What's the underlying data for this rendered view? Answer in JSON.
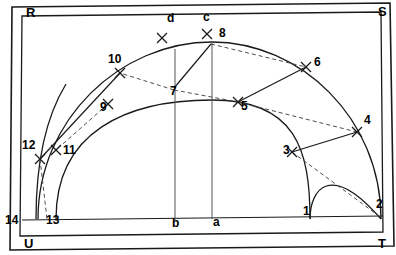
{
  "figure": {
    "type": "geometric-construction-diagram",
    "title": "",
    "background_color": "#ffffff",
    "ink_color": "#1a1a1a",
    "width": 396,
    "height": 255
  },
  "corner_labels": [
    {
      "id": "R",
      "text": "R",
      "x": 26,
      "y": 17
    },
    {
      "id": "S",
      "text": "S",
      "x": 378,
      "y": 16
    },
    {
      "id": "U",
      "text": "U",
      "x": 24,
      "y": 248
    },
    {
      "id": "T",
      "text": "T",
      "x": 378,
      "y": 248
    }
  ],
  "aux_labels": [
    {
      "id": "d",
      "text": "d",
      "x": 167,
      "y": 22
    },
    {
      "id": "c",
      "text": "c",
      "x": 203,
      "y": 21
    },
    {
      "id": "b",
      "text": "b",
      "x": 172,
      "y": 227
    },
    {
      "id": "a",
      "text": "a",
      "x": 213,
      "y": 226
    }
  ],
  "point_labels": [
    {
      "id": "1",
      "text": "1",
      "x": 303,
      "y": 215
    },
    {
      "id": "2",
      "text": "2",
      "x": 376,
      "y": 208
    },
    {
      "id": "3",
      "text": "3",
      "x": 283,
      "y": 154
    },
    {
      "id": "4",
      "text": "4",
      "x": 364,
      "y": 124
    },
    {
      "id": "5",
      "text": "5",
      "x": 241,
      "y": 110
    },
    {
      "id": "6",
      "text": "6",
      "x": 314,
      "y": 66
    },
    {
      "id": "7",
      "text": "7",
      "x": 170,
      "y": 95
    },
    {
      "id": "8",
      "text": "8",
      "x": 219,
      "y": 37
    },
    {
      "id": "9",
      "text": "9",
      "x": 100,
      "y": 111
    },
    {
      "id": "10",
      "text": "10",
      "x": 108,
      "y": 63
    },
    {
      "id": "11",
      "text": "11",
      "x": 63,
      "y": 154
    },
    {
      "id": "12",
      "text": "12",
      "x": 22,
      "y": 149
    },
    {
      "id": "13",
      "text": "13",
      "x": 46,
      "y": 224
    },
    {
      "id": "14",
      "text": "14",
      "x": 5,
      "y": 224
    }
  ],
  "cross_marks": [
    {
      "id": "mark-d",
      "x": 162,
      "y": 38
    },
    {
      "id": "mark-c",
      "x": 207,
      "y": 34
    },
    {
      "id": "mark-3",
      "x": 292,
      "y": 152
    },
    {
      "id": "mark-4",
      "x": 357,
      "y": 132
    },
    {
      "id": "mark-5",
      "x": 238,
      "y": 102
    },
    {
      "id": "mark-6",
      "x": 306,
      "y": 67
    },
    {
      "id": "mark-9",
      "x": 108,
      "y": 104
    },
    {
      "id": "mark-10",
      "x": 120,
      "y": 73
    },
    {
      "id": "mark-11",
      "x": 56,
      "y": 150
    },
    {
      "id": "mark-12",
      "x": 40,
      "y": 159
    }
  ],
  "frame": {
    "outer": "M 12,7 L 390,3 L 394,246 L 10,250 Z",
    "inner": "M 22,16 L 381,12 L 383,232 L 20,236 Z"
  },
  "baseline": {
    "from_x": 22,
    "from_y": 220,
    "to_x": 383,
    "to_y": 216
  },
  "arcs": {
    "outer_semicircle": "M 38,219 C 38,120 120,42 212,42 C 300,42 381,118 381,219",
    "inner_semicircle": "M 56,219 C 56,132 126,100 212,100 C 296,100 310,150 310,219",
    "small_left_arc": "M 36,219 C 36,170 44,120 66,84",
    "small_right_arc": "M 310,219 C 310,190 330,160 381,219"
  },
  "verticals": [
    {
      "id": "vert-b",
      "x1": 175,
      "y1": 49,
      "x2": 175,
      "y2": 220
    },
    {
      "id": "vert-a",
      "x1": 212,
      "y1": 42,
      "x2": 212,
      "y2": 219
    }
  ],
  "solid_chords": [
    {
      "id": "chord-7-8",
      "x1": 174,
      "y1": 88,
      "x2": 211,
      "y2": 44
    },
    {
      "id": "chord-5-6",
      "x1": 238,
      "y1": 102,
      "x2": 306,
      "y2": 67
    },
    {
      "id": "chord-3-4",
      "x1": 292,
      "y1": 152,
      "x2": 357,
      "y2": 132
    },
    {
      "id": "chord-12-10",
      "x1": 40,
      "y1": 159,
      "x2": 120,
      "y2": 73
    }
  ],
  "dashed_rays": [
    {
      "id": "ray-7-10",
      "x1": 174,
      "y1": 90,
      "x2": 120,
      "y2": 73
    },
    {
      "id": "ray-8-6",
      "x1": 211,
      "y1": 44,
      "x2": 306,
      "y2": 67
    },
    {
      "id": "ray-7-5",
      "x1": 174,
      "y1": 90,
      "x2": 238,
      "y2": 102
    },
    {
      "id": "ray-5-4",
      "x1": 238,
      "y1": 102,
      "x2": 357,
      "y2": 132
    },
    {
      "id": "ray-3-2",
      "x1": 292,
      "y1": 152,
      "x2": 379,
      "y2": 216
    },
    {
      "id": "ray-12-13",
      "x1": 40,
      "y1": 159,
      "x2": 47,
      "y2": 219
    },
    {
      "id": "ray-9-11",
      "x1": 108,
      "y1": 104,
      "x2": 56,
      "y2": 150
    }
  ]
}
